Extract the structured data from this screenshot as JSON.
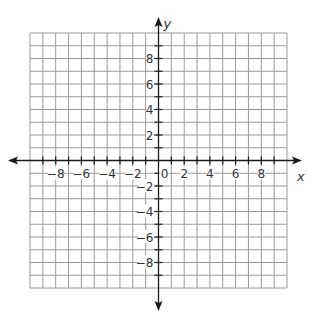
{
  "diagram": {
    "type": "coordinate-plane",
    "x_axis": {
      "label": "x",
      "min": -10,
      "max": 10,
      "labeled_ticks": [
        -8,
        -6,
        -4,
        -2,
        2,
        4,
        6,
        8
      ]
    },
    "y_axis": {
      "label": "y",
      "min": -10,
      "max": 10,
      "labeled_ticks": [
        -8,
        -6,
        -4,
        -2,
        2,
        4,
        6,
        8
      ]
    },
    "origin_label": "0",
    "grid_step": 1,
    "colors": {
      "grid": "#9a9a9a",
      "axis": "#1a1a1a",
      "label": "#333333"
    }
  }
}
